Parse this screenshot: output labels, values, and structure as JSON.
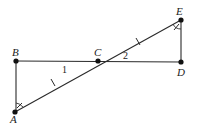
{
  "diagram": {
    "type": "geometry",
    "points": [
      {
        "id": "A",
        "label": "A",
        "x": 15,
        "y": 112
      },
      {
        "id": "B",
        "label": "B",
        "x": 16,
        "y": 61
      },
      {
        "id": "C",
        "label": "C",
        "x": 98,
        "y": 61
      },
      {
        "id": "D",
        "label": "D",
        "x": 181,
        "y": 62
      },
      {
        "id": "E",
        "label": "E",
        "x": 181,
        "y": 20
      }
    ],
    "segments": [
      {
        "from": "A",
        "to": "B"
      },
      {
        "from": "B",
        "to": "D"
      },
      {
        "from": "A",
        "to": "E"
      },
      {
        "from": "E",
        "to": "D"
      }
    ],
    "congruence_marks": {
      "segments": [
        "AC",
        "CE"
      ],
      "angles": [
        "A",
        "E"
      ]
    },
    "angle_labels": [
      {
        "label": "1",
        "at": "C",
        "side": "lower-left"
      },
      {
        "label": "2",
        "at": "C",
        "side": "upper-right"
      }
    ]
  },
  "labels": {
    "A": "A",
    "B": "B",
    "C": "C",
    "D": "D",
    "E": "E",
    "angle1": "1",
    "angle2": "2"
  }
}
